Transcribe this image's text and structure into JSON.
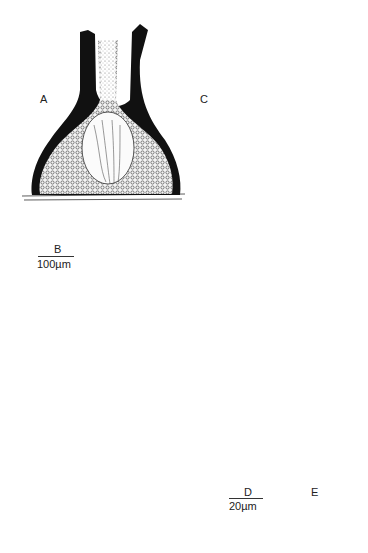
{
  "figure": {
    "panels": [
      {
        "id": "A",
        "label": "A",
        "subject": "perithecium-section-dark-wall"
      },
      {
        "id": "B",
        "label": "B",
        "subject": "perithecium-section-pale"
      },
      {
        "id": "C",
        "label": "C",
        "subject": "ostiolar-periphyses-cells"
      },
      {
        "id": "D",
        "label": "D",
        "subject": "ascus-with-paraphyses"
      },
      {
        "id": "E",
        "label": "E",
        "subject": "long-ascus-with-stalk"
      }
    ],
    "scale_bars": [
      {
        "panel": "B",
        "label": "B",
        "value_text": "100µm"
      },
      {
        "panel": "D",
        "label": "D",
        "value_text": "20µm"
      }
    ]
  },
  "colors": {
    "ink": "#1a1a1a",
    "background": "#ffffff",
    "stipple": "#555555"
  }
}
